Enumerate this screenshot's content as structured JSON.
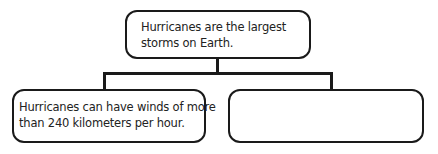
{
  "diagram": {
    "type": "hierarchy",
    "root": {
      "lines": [
        "Hurricanes are the largest",
        "storms on Earth."
      ]
    },
    "children": [
      {
        "lines": [
          "Hurricanes can have winds of more",
          "than 240 kilometers per hour."
        ]
      },
      {
        "lines": []
      }
    ],
    "colors": {
      "stroke": "#1a1a1a",
      "text": "#222222",
      "background": "#ffffff"
    }
  }
}
